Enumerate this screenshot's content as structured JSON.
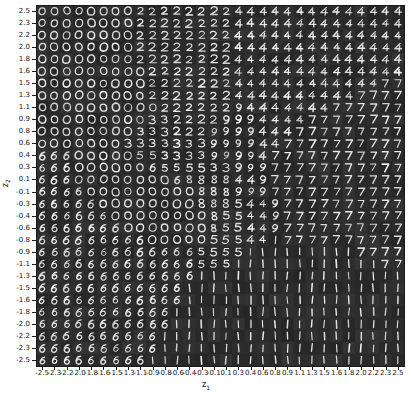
{
  "figure": {
    "title": "",
    "background_color": "#ffffff",
    "plot_background_color": "#2e2e2e",
    "digit_color": "#f2f2f2"
  },
  "axes": {
    "xlabel": "z",
    "xlabel_sub": "1",
    "ylabel": "z",
    "ylabel_sub": "2"
  },
  "chart_data": {
    "type": "heatmap",
    "title": "",
    "subtitle": "VAE learned MNIST digit manifold over 2-D latent space",
    "xlabel": "z1",
    "ylabel": "z2",
    "grid": false,
    "legend": "none",
    "xlim": [
      -2.5,
      2.5
    ],
    "ylim": [
      -2.5,
      2.5
    ],
    "n_rows": 30,
    "n_cols": 30,
    "cell_px": 12.27,
    "x_tick_labels": [
      "-2.5",
      "-2.3",
      "-2.2",
      "-2.0",
      "-1.8",
      "-1.6",
      "-1.5",
      "-1.3",
      "-1.1",
      "-0.9",
      "-0.8",
      "-0.6",
      "-0.4",
      "-0.3",
      "-0.1",
      "0.1",
      "0.3",
      "0.4",
      "0.6",
      "0.8",
      "0.9",
      "1.1",
      "1.3",
      "1.5",
      "1.6",
      "1.8",
      "2.0",
      "2.2",
      "2.3",
      "2.5"
    ],
    "y_tick_labels": [
      "2.5",
      "2.3",
      "2.2",
      "2.0",
      "1.8",
      "1.6",
      "1.5",
      "1.3",
      "1.1",
      "0.9",
      "0.8",
      "0.6",
      "0.4",
      "0.3",
      "0.1",
      "-0.1",
      "-0.3",
      "-0.4",
      "-0.6",
      "-0.8",
      "-0.9",
      "-1.1",
      "-1.3",
      "-1.5",
      "-1.6",
      "-1.8",
      "-2.0",
      "-2.2",
      "-2.3",
      "-2.5"
    ],
    "x_values": [
      -2.5,
      -2.33,
      -2.16,
      -1.99,
      -1.81,
      -1.64,
      -1.47,
      -1.3,
      -1.12,
      -0.95,
      -0.78,
      -0.61,
      -0.43,
      -0.26,
      -0.09,
      0.09,
      0.26,
      0.43,
      0.61,
      0.78,
      0.95,
      1.12,
      1.3,
      1.47,
      1.64,
      1.81,
      1.99,
      2.16,
      2.33,
      2.5
    ],
    "y_values": [
      2.5,
      2.33,
      2.16,
      1.99,
      1.81,
      1.64,
      1.47,
      1.3,
      1.12,
      0.95,
      0.78,
      0.61,
      0.43,
      0.26,
      0.09,
      -0.09,
      -0.26,
      -0.43,
      -0.61,
      -0.78,
      -0.95,
      -1.12,
      -1.3,
      -1.47,
      -1.64,
      -1.81,
      -1.99,
      -2.16,
      -2.33,
      -2.5
    ],
    "digit_grid": [
      [
        "0",
        "0",
        "0",
        "0",
        "0",
        "0",
        "0",
        "0",
        "2",
        "2",
        "2",
        "2",
        "2",
        "2",
        "2",
        "2",
        "4",
        "4",
        "4",
        "4",
        "4",
        "4",
        "4",
        "4",
        "4",
        "4",
        "4",
        "4",
        "4",
        "4"
      ],
      [
        "0",
        "0",
        "0",
        "0",
        "0",
        "0",
        "0",
        "0",
        "2",
        "2",
        "2",
        "2",
        "2",
        "2",
        "2",
        "2",
        "4",
        "4",
        "4",
        "4",
        "4",
        "4",
        "4",
        "4",
        "4",
        "4",
        "4",
        "4",
        "4",
        "4"
      ],
      [
        "0",
        "0",
        "0",
        "0",
        "0",
        "0",
        "0",
        "0",
        "2",
        "2",
        "2",
        "2",
        "2",
        "2",
        "2",
        "2",
        "4",
        "4",
        "4",
        "4",
        "4",
        "4",
        "4",
        "4",
        "4",
        "4",
        "4",
        "4",
        "4",
        "4"
      ],
      [
        "0",
        "0",
        "0",
        "0",
        "0",
        "0",
        "0",
        "0",
        "2",
        "2",
        "2",
        "2",
        "2",
        "2",
        "2",
        "2",
        "4",
        "4",
        "4",
        "4",
        "4",
        "4",
        "4",
        "4",
        "4",
        "4",
        "4",
        "4",
        "4",
        "4"
      ],
      [
        "0",
        "0",
        "0",
        "0",
        "0",
        "0",
        "0",
        "0",
        "2",
        "2",
        "2",
        "2",
        "2",
        "2",
        "2",
        "2",
        "4",
        "4",
        "4",
        "4",
        "4",
        "4",
        "4",
        "4",
        "4",
        "4",
        "4",
        "4",
        "4",
        "4"
      ],
      [
        "0",
        "0",
        "0",
        "0",
        "0",
        "0",
        "0",
        "0",
        "0",
        "2",
        "2",
        "2",
        "2",
        "2",
        "2",
        "2",
        "4",
        "4",
        "4",
        "4",
        "4",
        "4",
        "4",
        "4",
        "4",
        "4",
        "4",
        "4",
        "4",
        "4"
      ],
      [
        "0",
        "0",
        "0",
        "0",
        "0",
        "0",
        "0",
        "0",
        "0",
        "2",
        "2",
        "2",
        "2",
        "2",
        "2",
        "2",
        "4",
        "4",
        "4",
        "4",
        "4",
        "4",
        "4",
        "4",
        "4",
        "4",
        "4",
        "4",
        "7",
        "7"
      ],
      [
        "0",
        "0",
        "0",
        "0",
        "0",
        "0",
        "0",
        "0",
        "0",
        "2",
        "2",
        "2",
        "2",
        "2",
        "2",
        "2",
        "4",
        "4",
        "4",
        "4",
        "4",
        "4",
        "4",
        "4",
        "4",
        "4",
        "7",
        "7",
        "7",
        "7"
      ],
      [
        "0",
        "0",
        "0",
        "0",
        "0",
        "0",
        "0",
        "0",
        "0",
        "0",
        "2",
        "2",
        "2",
        "2",
        "2",
        "2",
        "9",
        "4",
        "4",
        "4",
        "4",
        "4",
        "4",
        "4",
        "7",
        "7",
        "7",
        "7",
        "7",
        "7"
      ],
      [
        "0",
        "0",
        "0",
        "0",
        "0",
        "0",
        "0",
        "0",
        "0",
        "3",
        "3",
        "2",
        "2",
        "2",
        "2",
        "9",
        "9",
        "9",
        "4",
        "4",
        "4",
        "4",
        "7",
        "7",
        "7",
        "7",
        "7",
        "7",
        "7",
        "7"
      ],
      [
        "0",
        "0",
        "0",
        "0",
        "0",
        "0",
        "0",
        "0",
        "3",
        "3",
        "3",
        "2",
        "2",
        "2",
        "9",
        "9",
        "9",
        "9",
        "4",
        "4",
        "4",
        "7",
        "7",
        "7",
        "7",
        "7",
        "7",
        "7",
        "7",
        "7"
      ],
      [
        "0",
        "0",
        "0",
        "0",
        "0",
        "0",
        "0",
        "3",
        "3",
        "3",
        "3",
        "3",
        "3",
        "3",
        "9",
        "9",
        "9",
        "9",
        "4",
        "4",
        "7",
        "7",
        "7",
        "7",
        "7",
        "7",
        "7",
        "7",
        "7",
        "7"
      ],
      [
        "6",
        "6",
        "6",
        "0",
        "0",
        "0",
        "0",
        "0",
        "5",
        "5",
        "3",
        "3",
        "3",
        "3",
        "9",
        "9",
        "9",
        "9",
        "4",
        "7",
        "7",
        "7",
        "7",
        "7",
        "7",
        "7",
        "7",
        "7",
        "7",
        "7"
      ],
      [
        "6",
        "6",
        "6",
        "0",
        "0",
        "0",
        "0",
        "0",
        "0",
        "6",
        "5",
        "5",
        "5",
        "5",
        "3",
        "3",
        "9",
        "9",
        "9",
        "7",
        "7",
        "7",
        "7",
        "7",
        "7",
        "7",
        "7",
        "7",
        "7",
        "7"
      ],
      [
        "6",
        "6",
        "6",
        "0",
        "0",
        "0",
        "0",
        "0",
        "0",
        "0",
        "0",
        "6",
        "8",
        "8",
        "8",
        "8",
        "4",
        "4",
        "9",
        "7",
        "7",
        "7",
        "7",
        "7",
        "7",
        "7",
        "7",
        "7",
        "7",
        "7"
      ],
      [
        "6",
        "6",
        "6",
        "6",
        "0",
        "0",
        "0",
        "0",
        "0",
        "0",
        "0",
        "0",
        "0",
        "8",
        "8",
        "8",
        "9",
        "9",
        "9",
        "7",
        "7",
        "7",
        "7",
        "7",
        "7",
        "7",
        "7",
        "7",
        "7",
        "7"
      ],
      [
        "6",
        "6",
        "6",
        "6",
        "6",
        "0",
        "0",
        "0",
        "0",
        "0",
        "0",
        "0",
        "0",
        "8",
        "8",
        "8",
        "5",
        "4",
        "4",
        "9",
        "7",
        "7",
        "7",
        "7",
        "7",
        "7",
        "7",
        "7",
        "7",
        "7"
      ],
      [
        "6",
        "6",
        "6",
        "6",
        "6",
        "6",
        "0",
        "0",
        "0",
        "0",
        "0",
        "0",
        "0",
        "0",
        "8",
        "5",
        "5",
        "4",
        "4",
        "9",
        "7",
        "7",
        "7",
        "7",
        "7",
        "7",
        "7",
        "7",
        "7",
        "7"
      ],
      [
        "6",
        "6",
        "6",
        "6",
        "6",
        "6",
        "6",
        "0",
        "0",
        "0",
        "0",
        "0",
        "0",
        "0",
        "8",
        "5",
        "5",
        "4",
        "4",
        "9",
        "7",
        "7",
        "7",
        "7",
        "7",
        "7",
        "7",
        "7",
        "7",
        "7"
      ],
      [
        "6",
        "6",
        "6",
        "6",
        "6",
        "6",
        "6",
        "6",
        "6",
        "0",
        "0",
        "0",
        "0",
        "0",
        "5",
        "5",
        "5",
        "4",
        "4",
        "1",
        "7",
        "7",
        "7",
        "7",
        "7",
        "7",
        "7",
        "7",
        "7",
        "7"
      ],
      [
        "6",
        "6",
        "6",
        "6",
        "6",
        "6",
        "6",
        "6",
        "6",
        "6",
        "6",
        "6",
        "6",
        "5",
        "5",
        "5",
        "5",
        "1",
        "1",
        "1",
        "1",
        "1",
        "1",
        "1",
        "1",
        "1",
        "7",
        "7",
        "7",
        "7"
      ],
      [
        "6",
        "6",
        "6",
        "6",
        "6",
        "6",
        "6",
        "6",
        "6",
        "6",
        "6",
        "6",
        "6",
        "5",
        "5",
        "5",
        "1",
        "1",
        "1",
        "1",
        "1",
        "1",
        "1",
        "1",
        "1",
        "1",
        "1",
        "1",
        "7",
        "7"
      ],
      [
        "6",
        "6",
        "6",
        "6",
        "6",
        "6",
        "6",
        "6",
        "6",
        "6",
        "6",
        "6",
        "6",
        "1",
        "1",
        "1",
        "1",
        "1",
        "1",
        "1",
        "1",
        "1",
        "1",
        "1",
        "1",
        "1",
        "1",
        "1",
        "1",
        "1"
      ],
      [
        "6",
        "6",
        "6",
        "6",
        "6",
        "6",
        "6",
        "6",
        "6",
        "6",
        "6",
        "6",
        "1",
        "1",
        "1",
        "1",
        "1",
        "1",
        "1",
        "1",
        "1",
        "1",
        "1",
        "1",
        "1",
        "1",
        "1",
        "1",
        "1",
        "1"
      ],
      [
        "6",
        "6",
        "6",
        "6",
        "6",
        "6",
        "6",
        "6",
        "6",
        "6",
        "6",
        "6",
        "1",
        "1",
        "1",
        "1",
        "1",
        "1",
        "1",
        "1",
        "1",
        "1",
        "1",
        "1",
        "1",
        "1",
        "1",
        "1",
        "1",
        "1"
      ],
      [
        "6",
        "6",
        "6",
        "6",
        "6",
        "6",
        "6",
        "6",
        "6",
        "6",
        "6",
        "1",
        "1",
        "1",
        "1",
        "1",
        "1",
        "1",
        "1",
        "1",
        "1",
        "1",
        "1",
        "1",
        "1",
        "1",
        "1",
        "1",
        "1",
        "1"
      ],
      [
        "6",
        "6",
        "6",
        "6",
        "6",
        "6",
        "6",
        "6",
        "6",
        "6",
        "6",
        "1",
        "1",
        "1",
        "1",
        "1",
        "1",
        "1",
        "1",
        "1",
        "1",
        "1",
        "1",
        "1",
        "1",
        "1",
        "1",
        "1",
        "1",
        "1"
      ],
      [
        "6",
        "6",
        "6",
        "6",
        "6",
        "6",
        "6",
        "6",
        "6",
        "6",
        "1",
        "1",
        "1",
        "1",
        "1",
        "1",
        "1",
        "1",
        "1",
        "1",
        "1",
        "1",
        "1",
        "1",
        "1",
        "1",
        "1",
        "1",
        "1",
        "1"
      ],
      [
        "6",
        "6",
        "6",
        "6",
        "6",
        "6",
        "6",
        "6",
        "6",
        "6",
        "1",
        "1",
        "1",
        "1",
        "1",
        "1",
        "1",
        "1",
        "1",
        "1",
        "1",
        "1",
        "1",
        "1",
        "1",
        "1",
        "1",
        "1",
        "1",
        "1"
      ],
      [
        "6",
        "6",
        "6",
        "6",
        "6",
        "6",
        "6",
        "6",
        "6",
        "1",
        "1",
        "1",
        "1",
        "1",
        "1",
        "1",
        "1",
        "1",
        "1",
        "1",
        "1",
        "1",
        "1",
        "1",
        "1",
        "1",
        "1",
        "1",
        "1",
        "1"
      ]
    ]
  }
}
